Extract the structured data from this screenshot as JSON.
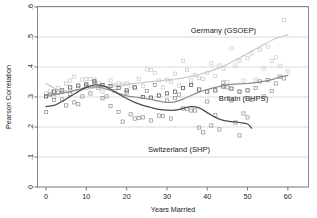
{
  "chart_data": {
    "type": "scatter",
    "title": "",
    "xlabel": "Years Married",
    "ylabel": "Pearson Correlation",
    "xlim": [
      -2,
      65
    ],
    "ylim": [
      0,
      0.6
    ],
    "xticks": [
      0,
      10,
      20,
      30,
      40,
      50,
      60
    ],
    "xtick_labels": [
      "0",
      "10",
      "20",
      "30",
      "40",
      "50",
      "60"
    ],
    "yticks": [
      0,
      0.1,
      0.2,
      0.3,
      0.4,
      0.5,
      0.6
    ],
    "ytick_labels": [
      "0",
      ".1",
      ".2",
      ".3",
      ".4",
      ".5",
      ".6"
    ],
    "grid": "horizontal",
    "legend_position": "inline-annotations",
    "marker": "open-square",
    "series": [
      {
        "name": "Germany (GSOEP)",
        "color": "#c8c8c8",
        "label_x": 44,
        "label_y": 0.515,
        "smooth": [
          [
            0,
            0.345
          ],
          [
            2,
            0.33
          ],
          [
            4,
            0.322
          ],
          [
            6,
            0.32
          ],
          [
            8,
            0.322
          ],
          [
            10,
            0.326
          ],
          [
            12,
            0.33
          ],
          [
            14,
            0.333
          ],
          [
            16,
            0.336
          ],
          [
            18,
            0.339
          ],
          [
            20,
            0.342
          ],
          [
            22,
            0.345
          ],
          [
            24,
            0.348
          ],
          [
            26,
            0.351
          ],
          [
            28,
            0.354
          ],
          [
            30,
            0.357
          ],
          [
            32,
            0.36
          ],
          [
            34,
            0.364
          ],
          [
            36,
            0.369
          ],
          [
            38,
            0.375
          ],
          [
            40,
            0.383
          ],
          [
            42,
            0.392
          ],
          [
            44,
            0.403
          ],
          [
            46,
            0.416
          ],
          [
            48,
            0.43
          ],
          [
            50,
            0.445
          ],
          [
            52,
            0.46
          ],
          [
            54,
            0.475
          ],
          [
            56,
            0.489
          ],
          [
            58,
            0.5
          ],
          [
            60,
            0.508
          ]
        ],
        "points": [
          [
            0,
            0.312
          ],
          [
            1,
            0.318
          ],
          [
            2,
            0.3
          ],
          [
            3,
            0.33
          ],
          [
            4,
            0.318
          ],
          [
            5,
            0.345
          ],
          [
            6,
            0.355
          ],
          [
            7,
            0.368
          ],
          [
            8,
            0.33
          ],
          [
            9,
            0.358
          ],
          [
            10,
            0.36
          ],
          [
            11,
            0.36
          ],
          [
            12,
            0.358
          ],
          [
            13,
            0.345
          ],
          [
            14,
            0.318
          ],
          [
            15,
            0.33
          ],
          [
            16,
            0.355
          ],
          [
            17,
            0.34
          ],
          [
            18,
            0.345
          ],
          [
            19,
            0.342
          ],
          [
            20,
            0.345
          ],
          [
            21,
            0.338
          ],
          [
            22,
            0.33
          ],
          [
            23,
            0.36
          ],
          [
            24,
            0.336
          ],
          [
            25,
            0.392
          ],
          [
            26,
            0.39
          ],
          [
            27,
            0.38
          ],
          [
            28,
            0.355
          ],
          [
            29,
            0.332
          ],
          [
            30,
            0.358
          ],
          [
            31,
            0.35
          ],
          [
            32,
            0.378
          ],
          [
            33,
            0.338
          ],
          [
            34,
            0.42
          ],
          [
            35,
            0.39
          ],
          [
            36,
            0.355
          ],
          [
            37,
            0.372
          ],
          [
            38,
            0.363
          ],
          [
            39,
            0.36
          ],
          [
            40,
            0.38
          ],
          [
            41,
            0.412
          ],
          [
            42,
            0.37
          ],
          [
            43,
            0.405
          ],
          [
            44,
            0.395
          ],
          [
            45,
            0.35
          ],
          [
            46,
            0.462
          ],
          [
            47,
            0.405
          ],
          [
            48,
            0.42
          ],
          [
            49,
            0.355
          ],
          [
            50,
            0.43
          ],
          [
            51,
            0.445
          ],
          [
            52,
            0.358
          ],
          [
            53,
            0.458
          ],
          [
            54,
            0.395
          ],
          [
            55,
            0.468
          ],
          [
            56,
            0.42
          ],
          [
            57,
            0.432
          ],
          [
            58,
            0.404
          ],
          [
            59,
            0.556
          ],
          [
            60,
            0.385
          ]
        ]
      },
      {
        "name": "Britain (BHPS)",
        "color": "#8c8c8c",
        "label_x": 49,
        "label_y": 0.288,
        "smooth": [
          [
            0,
            0.305
          ],
          [
            2,
            0.308
          ],
          [
            4,
            0.312
          ],
          [
            6,
            0.318
          ],
          [
            8,
            0.325
          ],
          [
            10,
            0.332
          ],
          [
            12,
            0.334
          ],
          [
            14,
            0.33
          ],
          [
            16,
            0.322
          ],
          [
            18,
            0.312
          ],
          [
            20,
            0.304
          ],
          [
            22,
            0.3
          ],
          [
            24,
            0.296
          ],
          [
            26,
            0.292
          ],
          [
            28,
            0.286
          ],
          [
            30,
            0.282
          ],
          [
            32,
            0.284
          ],
          [
            34,
            0.293
          ],
          [
            36,
            0.305
          ],
          [
            38,
            0.316
          ],
          [
            40,
            0.325
          ],
          [
            42,
            0.332
          ],
          [
            44,
            0.338
          ],
          [
            46,
            0.342
          ],
          [
            48,
            0.344
          ],
          [
            50,
            0.345
          ],
          [
            52,
            0.348
          ],
          [
            54,
            0.352
          ],
          [
            56,
            0.358
          ],
          [
            58,
            0.366
          ],
          [
            60,
            0.372
          ]
        ],
        "points": [
          [
            0,
            0.25
          ],
          [
            1,
            0.308
          ],
          [
            2,
            0.29
          ],
          [
            3,
            0.315
          ],
          [
            4,
            0.292
          ],
          [
            5,
            0.272
          ],
          [
            6,
            0.31
          ],
          [
            7,
            0.282
          ],
          [
            8,
            0.276
          ],
          [
            9,
            0.302
          ],
          [
            10,
            0.338
          ],
          [
            11,
            0.312
          ],
          [
            12,
            0.348
          ],
          [
            13,
            0.33
          ],
          [
            14,
            0.296
          ],
          [
            15,
            0.302
          ],
          [
            16,
            0.27
          ],
          [
            17,
            0.32
          ],
          [
            18,
            0.25
          ],
          [
            19,
            0.218
          ],
          [
            20,
            0.315
          ],
          [
            21,
            0.242
          ],
          [
            22,
            0.228
          ],
          [
            23,
            0.23
          ],
          [
            24,
            0.232
          ],
          [
            25,
            0.32
          ],
          [
            26,
            0.222
          ],
          [
            27,
            0.34
          ],
          [
            28,
            0.238
          ],
          [
            29,
            0.236
          ],
          [
            30,
            0.288
          ],
          [
            31,
            0.228
          ],
          [
            32,
            0.296
          ],
          [
            33,
            0.308
          ],
          [
            34,
            0.262
          ],
          [
            35,
            0.26
          ],
          [
            36,
            0.255
          ],
          [
            37,
            0.255
          ],
          [
            38,
            0.198
          ],
          [
            39,
            0.182
          ],
          [
            40,
            0.285
          ],
          [
            41,
            0.205
          ],
          [
            42,
            0.24
          ],
          [
            43,
            0.192
          ],
          [
            44,
            0.348
          ],
          [
            45,
            0.332
          ],
          [
            46,
            0.288
          ],
          [
            47,
            0.215
          ],
          [
            48,
            0.172
          ],
          [
            49,
            0.245
          ],
          [
            50,
            0.232
          ],
          [
            51,
            0.29
          ],
          [
            52,
            0.33
          ],
          [
            53,
            0.352
          ],
          [
            54,
            0.302
          ],
          [
            55,
            0.356
          ],
          [
            56,
            0.32
          ],
          [
            57,
            0.345
          ],
          [
            58,
            0.368
          ],
          [
            59,
            0.362
          ]
        ]
      },
      {
        "name": "Switzerland (SHP)",
        "color": "#4a4a4a",
        "label_x": 33,
        "label_y": 0.118,
        "smooth": [
          [
            0,
            0.268
          ],
          [
            2,
            0.272
          ],
          [
            4,
            0.285
          ],
          [
            6,
            0.302
          ],
          [
            8,
            0.318
          ],
          [
            10,
            0.332
          ],
          [
            12,
            0.34
          ],
          [
            14,
            0.338
          ],
          [
            16,
            0.326
          ],
          [
            18,
            0.31
          ],
          [
            20,
            0.295
          ],
          [
            22,
            0.282
          ],
          [
            24,
            0.272
          ],
          [
            26,
            0.265
          ],
          [
            28,
            0.259
          ],
          [
            30,
            0.256
          ],
          [
            32,
            0.256
          ],
          [
            34,
            0.262
          ],
          [
            36,
            0.268
          ],
          [
            38,
            0.264
          ],
          [
            40,
            0.248
          ],
          [
            42,
            0.232
          ],
          [
            44,
            0.222
          ],
          [
            46,
            0.218
          ],
          [
            48,
            0.215
          ],
          [
            50,
            0.21
          ],
          [
            51,
            0.196
          ]
        ],
        "points": [
          [
            0,
            0.302
          ],
          [
            2,
            0.318
          ],
          [
            4,
            0.322
          ],
          [
            6,
            0.332
          ],
          [
            8,
            0.338
          ],
          [
            10,
            0.342
          ],
          [
            12,
            0.352
          ],
          [
            14,
            0.34
          ],
          [
            16,
            0.336
          ],
          [
            18,
            0.33
          ],
          [
            20,
            0.322
          ],
          [
            22,
            0.332
          ],
          [
            24,
            0.3
          ],
          [
            26,
            0.298
          ],
          [
            28,
            0.305
          ],
          [
            30,
            0.312
          ],
          [
            32,
            0.318
          ],
          [
            34,
            0.33
          ],
          [
            36,
            0.34
          ],
          [
            38,
            0.325
          ],
          [
            40,
            0.318
          ],
          [
            42,
            0.322
          ],
          [
            44,
            0.335
          ],
          [
            46,
            0.328
          ],
          [
            48,
            0.318
          ],
          [
            50,
            0.322
          ]
        ]
      }
    ]
  }
}
